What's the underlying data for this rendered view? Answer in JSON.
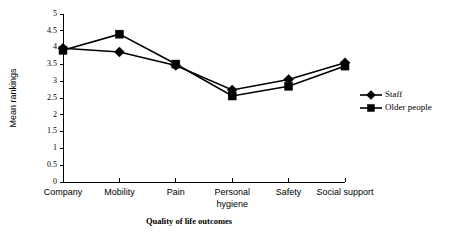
{
  "chart_data": {
    "type": "line",
    "title": "",
    "xlabel": "Quality of life outcomes",
    "ylabel": "Mean rankings",
    "categories": [
      "Company",
      "Mobility",
      "Pain",
      "Personal hygiene",
      "Safety",
      "Social support"
    ],
    "category_lines": [
      [
        "Company"
      ],
      [
        "Mobility"
      ],
      [
        "Pain"
      ],
      [
        "Personal",
        "hygiene"
      ],
      [
        "Safety"
      ],
      [
        "Social support"
      ]
    ],
    "series": [
      {
        "name": "Staff",
        "marker": "diamond",
        "color": "#000000",
        "values": [
          3.98,
          3.87,
          3.47,
          2.74,
          3.05,
          3.55
        ]
      },
      {
        "name": "Older people",
        "marker": "square",
        "color": "#000000",
        "values": [
          3.92,
          4.4,
          3.51,
          2.56,
          2.85,
          3.45
        ]
      }
    ],
    "ylim": [
      0,
      5
    ],
    "ytick_step": 0.5,
    "ytick_labels": [
      "0",
      "0.5",
      "1",
      "1.5",
      "2",
      "2.5",
      "3",
      "3.5",
      "4",
      "4.5",
      "5"
    ],
    "ytick_values": [
      0,
      0.5,
      1,
      1.5,
      2,
      2.5,
      3,
      3.5,
      4,
      4.5,
      5
    ],
    "grid": false,
    "legend_position": "right"
  }
}
